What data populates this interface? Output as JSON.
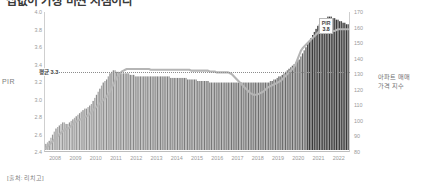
{
  "title": "집값이 가장 비싼 시점이다",
  "source_note": "[출처: 리치고]",
  "axes": {
    "left_title": "PIR",
    "right_title_line1": "아파트 매매",
    "right_title_line2": "가격 지수",
    "left_ticks": [
      "4.0",
      "3.8",
      "3.6",
      "3.4",
      "3.2",
      "3.0",
      "2.8",
      "2.6",
      "2.4"
    ],
    "right_ticks": [
      "170",
      "160",
      "150",
      "140",
      "130",
      "120",
      "110",
      "100",
      "90",
      "80"
    ],
    "x_ticks": [
      "2008",
      "2009",
      "2010",
      "2011",
      "2012",
      "2013",
      "2014",
      "2015",
      "2016",
      "2017",
      "2018",
      "2019",
      "2020",
      "2021",
      "2022"
    ]
  },
  "annotations": {
    "average_label": "평균 3.3",
    "peak_label": "PIR",
    "peak_value": "3.8"
  },
  "colors": {
    "bar_light": "#c8c8c8",
    "bar_dark": "#5a5a5a",
    "line": "#b5b5b5",
    "grid": "#c9c9c9",
    "text": "#9a9a9a"
  },
  "chart_data": {
    "type": "line",
    "title": "집값이 가장 비싼 시점이다",
    "xlabel": "",
    "ylabel": "PIR",
    "y2label": "아파트 매매 가격 지수",
    "ylim": [
      2.4,
      4.0
    ],
    "y2lim": [
      80,
      170
    ],
    "grid": false,
    "legend": "none",
    "average_line": 3.3,
    "x": [
      "2008",
      "2009",
      "2010",
      "2011",
      "2012",
      "2013",
      "2014",
      "2015",
      "2016",
      "2017",
      "2018",
      "2019",
      "2020",
      "2021",
      "2022"
    ],
    "series": [
      {
        "name": "아파트 매매 가격 지수",
        "type": "bar",
        "axis": "right",
        "values_monthly": [
          84,
          85,
          86,
          88,
          90,
          92,
          94,
          95,
          96,
          97,
          98,
          98,
          97,
          97,
          98,
          99,
          100,
          101,
          102,
          103,
          104,
          105,
          106,
          107,
          107,
          108,
          109,
          110,
          112,
          114,
          116,
          118,
          120,
          122,
          124,
          125,
          126,
          128,
          130,
          131,
          132,
          132,
          131,
          131,
          130,
          130,
          130,
          130,
          130,
          130,
          129,
          129,
          129,
          128,
          128,
          128,
          128,
          128,
          128,
          128,
          128,
          128,
          128,
          128,
          128,
          128,
          128,
          128,
          128,
          128,
          128,
          128,
          128,
          128,
          127,
          127,
          127,
          127,
          127,
          127,
          127,
          127,
          127,
          127,
          126,
          126,
          126,
          126,
          126,
          126,
          125,
          125,
          125,
          125,
          125,
          125,
          125,
          124,
          124,
          124,
          124,
          124,
          124,
          124,
          124,
          124,
          124,
          124,
          124,
          124,
          124,
          124,
          124,
          124,
          124,
          124,
          124,
          124,
          124,
          124,
          124,
          124,
          124,
          124,
          124,
          124,
          124,
          124,
          124,
          124,
          124,
          124,
          124,
          125,
          125,
          126,
          126,
          127,
          128,
          128,
          129,
          130,
          131,
          132,
          133,
          134,
          135,
          136,
          137,
          138,
          139,
          141,
          143,
          145,
          147,
          149,
          151,
          153,
          155,
          157,
          159,
          161,
          162,
          163,
          164,
          165,
          166,
          167,
          167,
          167,
          166,
          166,
          165,
          165,
          164,
          164,
          163,
          163,
          162,
          162
        ]
      },
      {
        "name": "PIR",
        "type": "line",
        "axis": "left",
        "values_monthly": [
          2.42,
          2.44,
          2.46,
          2.48,
          2.5,
          2.52,
          2.54,
          2.56,
          2.58,
          2.6,
          2.62,
          2.63,
          2.64,
          2.65,
          2.66,
          2.68,
          2.7,
          2.72,
          2.73,
          2.74,
          2.75,
          2.76,
          2.77,
          2.78,
          2.79,
          2.8,
          2.82,
          2.84,
          2.86,
          2.88,
          2.9,
          2.92,
          2.94,
          2.96,
          2.98,
          3.0,
          3.02,
          3.05,
          3.08,
          3.12,
          3.16,
          3.2,
          3.24,
          3.27,
          3.29,
          3.31,
          3.32,
          3.33,
          3.34,
          3.34,
          3.34,
          3.34,
          3.34,
          3.34,
          3.34,
          3.34,
          3.34,
          3.34,
          3.34,
          3.34,
          3.34,
          3.34,
          3.33,
          3.33,
          3.33,
          3.33,
          3.33,
          3.33,
          3.33,
          3.33,
          3.33,
          3.33,
          3.33,
          3.33,
          3.33,
          3.33,
          3.33,
          3.33,
          3.33,
          3.33,
          3.33,
          3.33,
          3.33,
          3.33,
          3.33,
          3.33,
          3.32,
          3.32,
          3.32,
          3.32,
          3.32,
          3.32,
          3.32,
          3.32,
          3.32,
          3.32,
          3.32,
          3.31,
          3.31,
          3.31,
          3.31,
          3.3,
          3.3,
          3.3,
          3.3,
          3.3,
          3.3,
          3.3,
          3.3,
          3.29,
          3.28,
          3.26,
          3.24,
          3.22,
          3.2,
          3.18,
          3.16,
          3.14,
          3.12,
          3.1,
          3.08,
          3.06,
          3.05,
          3.04,
          3.04,
          3.04,
          3.05,
          3.06,
          3.07,
          3.08,
          3.1,
          3.12,
          3.13,
          3.14,
          3.15,
          3.16,
          3.17,
          3.18,
          3.19,
          3.2,
          3.22,
          3.24,
          3.26,
          3.28,
          3.3,
          3.32,
          3.34,
          3.36,
          3.4,
          3.45,
          3.5,
          3.55,
          3.58,
          3.6,
          3.62,
          3.64,
          3.66,
          3.68,
          3.7,
          3.72,
          3.74,
          3.76,
          3.78,
          3.79,
          3.8,
          3.8,
          3.8,
          3.8,
          3.79,
          3.79,
          3.78,
          3.78,
          3.79,
          3.8,
          3.8,
          3.8,
          3.8,
          3.8,
          3.8,
          3.8
        ]
      }
    ]
  }
}
